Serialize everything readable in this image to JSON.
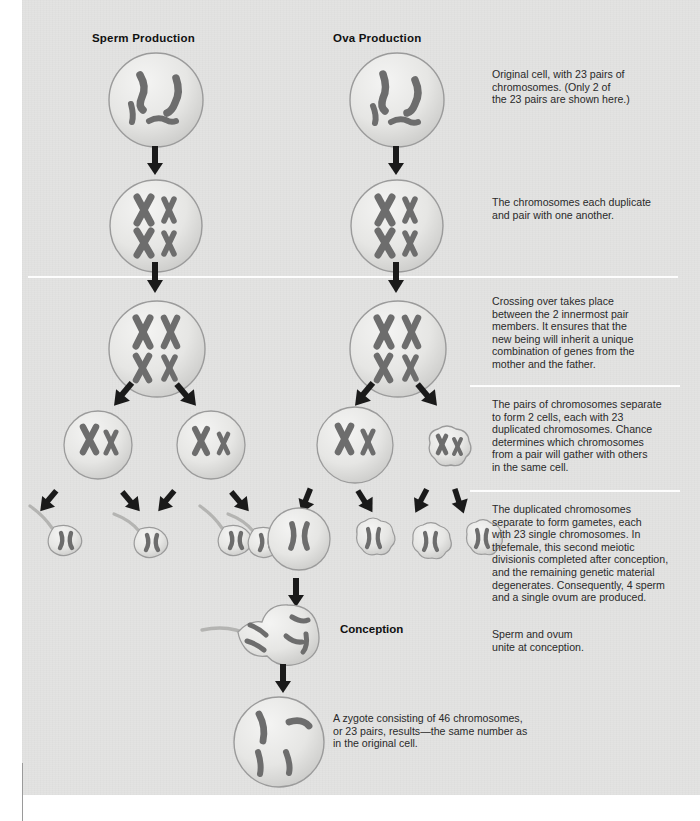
{
  "page": {
    "width": 700,
    "height": 821,
    "background": "#ffffff",
    "board_background": "#e3e3e2",
    "cell_fill": "#e9e9e8",
    "cell_stroke": "#9b9b9b",
    "chromosome_fill": "#9e9e9e",
    "chromosome_stroke": "#6a6a6a",
    "arrow_color": "#1a1a1a",
    "divider_color": "#fdfdfd",
    "text_color": "#2a2a2a"
  },
  "columns": [
    {
      "id": "sperm",
      "title": "Sperm Production",
      "x": 92,
      "y": 32
    },
    {
      "id": "ova",
      "title": "Ova Production",
      "x": 333,
      "y": 32
    }
  ],
  "dividers": [
    {
      "y": 276,
      "x": 28,
      "w": 650
    },
    {
      "y": 385,
      "x": 470,
      "w": 208
    },
    {
      "y": 490,
      "x": 470,
      "w": 208
    }
  ],
  "stages": [
    {
      "id": "original-cell",
      "name": "original-cell",
      "note": "Original cell, with 23 pairs of\nchromosomes. (Only 2 of\nthe 23 pairs are shown here.)",
      "note_x": 492,
      "note_y": 70
    },
    {
      "id": "duplicated-chromosomes",
      "name": "duplicated-chromosomes",
      "note": "The chromosomes each duplicate\nand pair with one another.",
      "note_x": 492,
      "note_y": 198
    },
    {
      "id": "crossing-over",
      "name": "crossing-over",
      "note": "Crossing over takes place\nbetween the 2 innermost pair\nmembers. It ensures that the\nnew being will inherit a unique\ncombination of genes from the\nmother and the father.",
      "note_x": 492,
      "note_y": 297
    },
    {
      "id": "first-meiotic-division",
      "name": "first-meiotic-division",
      "note": "The pairs of chromosomes separate\nto form 2 cells, each with 23\nduplicated chromosomes. Chance\ndetermines which chromosomes\nfrom a pair will gather with others\nin the same cell.",
      "note_x": 492,
      "note_y": 400
    },
    {
      "id": "second-meiotic-division",
      "name": "second-meiotic-division",
      "note": "The duplicated chromosomes\nseparate to form gametes, each\nwith 23 single chromosomes. In\nthefemale, this second meiotic\ndivisionis completed after conception,\nand the remaining genetic material\ndegenerates. Consequently, 4 sperm\nand a single ovum are produced.",
      "note_x": 492,
      "note_y": 505
    },
    {
      "id": "conception",
      "name": "conception",
      "label": "Conception",
      "label_x": 340,
      "label_y": 624,
      "note": "Sperm and ovum\nunite at conception.",
      "note_x": 492,
      "note_y": 630
    },
    {
      "id": "zygote",
      "name": "zygote",
      "note": "A zygote consisting of 46 chromosomes,\nor 23 pairs, results—the same number as\nin the original cell.",
      "note_x": 333,
      "note_y": 714
    }
  ]
}
